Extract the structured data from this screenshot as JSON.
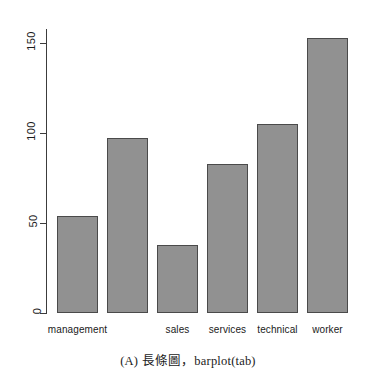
{
  "figure": {
    "caption": "(A) 長條圖，barplot(tab)",
    "background_color": "#ffffff"
  },
  "chart_data": {
    "type": "bar",
    "title": "",
    "subtitle": "",
    "xlabel": "",
    "ylabel": "",
    "categories": [
      "management",
      "office",
      "sales",
      "services",
      "technical",
      "worker"
    ],
    "visible_tick_labels": [
      "management",
      "",
      "sales",
      "services",
      "technical",
      "worker"
    ],
    "values": [
      54,
      97,
      38,
      83,
      105,
      153
    ],
    "ylim": [
      0,
      160
    ],
    "y_ticks": [
      0,
      50,
      100,
      150
    ],
    "y_tick_labels": [
      "0",
      "50",
      "100",
      "150"
    ],
    "grid": false,
    "legend": false,
    "legend_position": "none",
    "orientation": "vertical",
    "bar_fill_color": "#919191",
    "bar_border_color": "#4a4a4a",
    "axis_color": "#3c3c3c",
    "y_axis_label_rotation": -90
  }
}
